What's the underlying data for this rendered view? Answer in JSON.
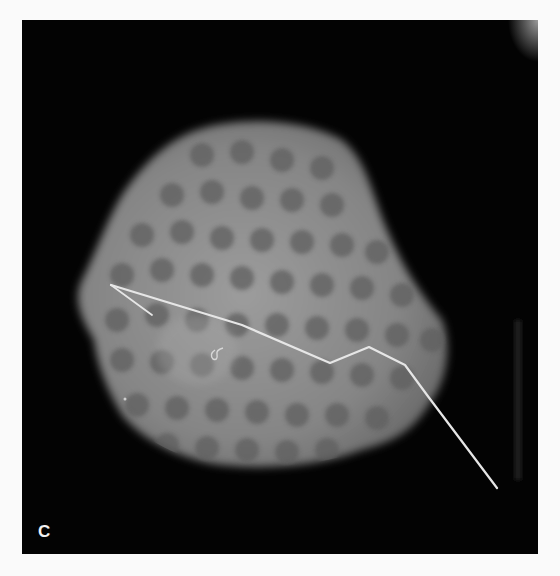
{
  "figure": {
    "panel_label": "C",
    "colors": {
      "background": "#030303",
      "tissue": "#8a8a8a",
      "nodules": "#5a5a5a",
      "wire": "#e6e6e6",
      "page": "#fafafa"
    }
  }
}
